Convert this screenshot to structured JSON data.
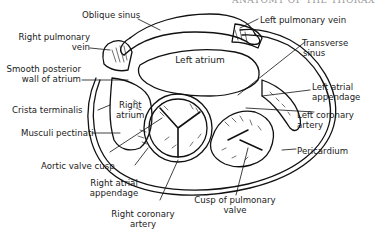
{
  "header": {
    "running_head_partial": "ANATOMY OF THE THORAX"
  },
  "diagram": {
    "center_label": "Left atrium",
    "labels": {
      "oblique_sinus": "Oblique sinus",
      "left_pulmonary_vein": "Left pulmonary vein",
      "right_pulmonary_vein_1": "Right pulmonary",
      "right_pulmonary_vein_2": "vein",
      "transverse_sinus_1": "Transverse",
      "transverse_sinus_2": "sinus",
      "smooth_posterior_wall_1": "Smooth posterior",
      "smooth_posterior_wall_2": "wall of atrium",
      "left_atrial_appendage_1": "Left atrial",
      "left_atrial_appendage_2": "appendage",
      "crista_terminalis": "Crista terminalis",
      "right_atrium_1": "Right",
      "right_atrium_2": "atrium",
      "left_coronary_artery_1": "Left coronary",
      "left_coronary_artery_2": "artery",
      "musculi_pectinati": "Musculi pectinati",
      "pericardium": "Pericardium",
      "aortic_valve_cusp": "Aortic valve cusp",
      "right_atrial_appendage_1": "Right atrial",
      "right_atrial_appendage_2": "appendage",
      "cusp_pulmonary_valve_1": "Cusp of pulmonary",
      "cusp_pulmonary_valve_2": "valve",
      "right_coronary_artery_1": "Right coronary",
      "right_coronary_artery_2": "artery"
    }
  }
}
